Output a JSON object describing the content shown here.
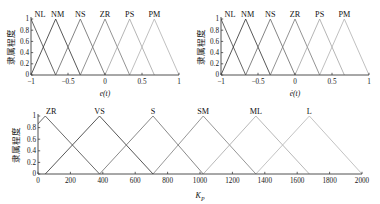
{
  "figure": {
    "ylabel_cn": "隶属程度",
    "y_ticks": [
      "0",
      "0.2",
      "0.4",
      "0.6",
      "0.8",
      "1"
    ]
  },
  "chart_data": [
    {
      "id": "e",
      "type": "line",
      "title": "",
      "xlabel": "e(t)",
      "ylabel": "隶属程度",
      "xlim": [
        -1,
        1
      ],
      "ylim": [
        0,
        1
      ],
      "grid": false,
      "legend": "inline-top-labels",
      "x_ticks": [
        -1,
        -0.5,
        0,
        0.5,
        1
      ],
      "x_tick_labels": [
        "-1",
        "-0.5",
        "0",
        "0.5",
        "1"
      ],
      "y_ticks": [
        0,
        0.2,
        0.4,
        0.6,
        0.8,
        1
      ],
      "y_tick_labels": [
        "0",
        "0.2",
        "0.4",
        "0.6",
        "0.8",
        "1"
      ],
      "series": [
        {
          "name": "NL",
          "peak": -1.0,
          "left": -1.3333,
          "right": -0.6667,
          "color": "#4a4a4a"
        },
        {
          "name": "NM",
          "peak": -0.6667,
          "left": -1.0,
          "right": -0.3333,
          "color": "#3a3a3a"
        },
        {
          "name": "NS",
          "peak": -0.3333,
          "left": -0.6667,
          "right": 0.0,
          "color": "#6e6e6e"
        },
        {
          "name": "ZR",
          "peak": 0.0,
          "left": -0.3333,
          "right": 0.3333,
          "color": "#808080"
        },
        {
          "name": "PS",
          "peak": 0.3333,
          "left": 0.0,
          "right": 0.6667,
          "color": "#a8a8a8"
        },
        {
          "name": "PM",
          "peak": 0.6667,
          "left": 0.3333,
          "right": 1.0,
          "color": "#b5b5b5"
        }
      ]
    },
    {
      "id": "edot",
      "type": "line",
      "title": "",
      "xlabel": "ė(t)",
      "ylabel": "隶属程度",
      "xlim": [
        -1,
        1
      ],
      "ylim": [
        0,
        1
      ],
      "grid": false,
      "legend": "inline-top-labels",
      "x_ticks": [
        -1,
        -0.5,
        0,
        0.5,
        1
      ],
      "x_tick_labels": [
        "-1",
        "-0.5",
        "0",
        "0.5",
        "1"
      ],
      "y_ticks": [
        0,
        0.2,
        0.4,
        0.6,
        0.8,
        1
      ],
      "y_tick_labels": [
        "0",
        "0.2",
        "0.4",
        "0.6",
        "0.8",
        "1"
      ],
      "series": [
        {
          "name": "NL",
          "peak": -1.0,
          "left": -1.3333,
          "right": -0.6667,
          "color": "#4a4a4a"
        },
        {
          "name": "NM",
          "peak": -0.6667,
          "left": -1.0,
          "right": -0.3333,
          "color": "#3a3a3a"
        },
        {
          "name": "NS",
          "peak": -0.3333,
          "left": -0.6667,
          "right": 0.0,
          "color": "#6e6e6e"
        },
        {
          "name": "ZR",
          "peak": 0.0,
          "left": -0.3333,
          "right": 0.3333,
          "color": "#808080"
        },
        {
          "name": "PS",
          "peak": 0.3333,
          "left": 0.0,
          "right": 0.6667,
          "color": "#a8a8a8"
        },
        {
          "name": "PM",
          "peak": 0.6667,
          "left": 0.3333,
          "right": 1.0,
          "color": "#b5b5b5"
        }
      ]
    },
    {
      "id": "kp",
      "type": "line",
      "title": "",
      "xlabel": "K_P",
      "xlabel_base": "K",
      "xlabel_sub": "P",
      "ylabel": "隶属程度",
      "xlim": [
        0,
        2000
      ],
      "ylim": [
        0,
        1
      ],
      "grid": false,
      "legend": "inline-top-labels",
      "x_ticks": [
        0,
        200,
        400,
        600,
        800,
        1000,
        1200,
        1400,
        1600,
        1800,
        2000
      ],
      "x_tick_labels": [
        "0",
        "200",
        "400",
        "600",
        "800",
        "1000",
        "1200",
        "1400",
        "1600",
        "1800",
        "2000"
      ],
      "y_ticks": [
        0,
        0.2,
        0.4,
        0.6,
        0.8,
        1
      ],
      "y_tick_labels": [
        "0",
        "0.2",
        "0.4",
        "0.6",
        "0.8",
        "1"
      ],
      "series": [
        {
          "name": "ZR",
          "peak": 45,
          "left": -290,
          "right": 380,
          "color": "#4f4f4f"
        },
        {
          "name": "VS",
          "peak": 380,
          "left": 45,
          "right": 710,
          "color": "#3a3a3a"
        },
        {
          "name": "S",
          "peak": 710,
          "left": 380,
          "right": 1020,
          "color": "#747474"
        },
        {
          "name": "SM",
          "peak": 1020,
          "left": 710,
          "right": 1345,
          "color": "#848484"
        },
        {
          "name": "ML",
          "peak": 1345,
          "left": 1020,
          "right": 1675,
          "color": "#ababab"
        },
        {
          "name": "L",
          "peak": 1675,
          "left": 1345,
          "right": 2000,
          "color": "#b8b8b8"
        }
      ]
    }
  ]
}
